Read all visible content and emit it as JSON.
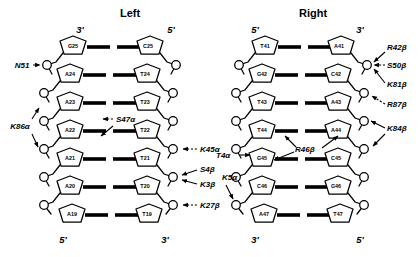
{
  "figure": {
    "type": "dna-protein-contact-map",
    "panels": [
      {
        "id": "left",
        "title": "Left",
        "top_left_end": "3'",
        "top_right_end": "5'",
        "bottom_left_end": "5'",
        "bottom_right_end": "3'",
        "strand_left": [
          "G25",
          "A24",
          "A23",
          "A22",
          "A21",
          "A20",
          "A19"
        ],
        "strand_right": [
          "C25",
          "T24",
          "T23",
          "T22",
          "T21",
          "T20",
          "T19"
        ],
        "annotations": [
          {
            "label": "N51",
            "side": "left",
            "style": "solid",
            "target_index": 0
          },
          {
            "label": "K86α",
            "side": "left",
            "style": "solid",
            "target_index": 1
          },
          {
            "label": "K86α",
            "side": "left",
            "style": "solid",
            "target_index": 2
          },
          {
            "label": "S47α",
            "side": "inner-left",
            "style": "dashed",
            "target_index": 2
          },
          {
            "label": "K45α",
            "side": "right",
            "style": "dashed",
            "target_index": 3
          },
          {
            "label": "S4β",
            "side": "right",
            "style": "solid",
            "target_index": 4
          },
          {
            "label": "K3β",
            "side": "right",
            "style": "solid",
            "target_index": 4
          },
          {
            "label": "K27β",
            "side": "right",
            "style": "dashed",
            "target_index": 5
          }
        ]
      },
      {
        "id": "right",
        "title": "Right",
        "top_left_end": "5'",
        "top_right_end": "3'",
        "bottom_left_end": "3'",
        "bottom_right_end": "5'",
        "strand_left": [
          "T41",
          "G42",
          "T43",
          "T44",
          "G45",
          "C46",
          "A47"
        ],
        "strand_right": [
          "A41",
          "C42",
          "A43",
          "A44",
          "C45",
          "G46",
          "T47"
        ],
        "annotations": [
          {
            "label": "R42β",
            "side": "right",
            "style": "solid",
            "target_index": 0
          },
          {
            "label": "S50β",
            "side": "right",
            "style": "dashed",
            "target_index": 0
          },
          {
            "label": "K81β",
            "side": "right",
            "style": "solid",
            "target_index": 0
          },
          {
            "label": "R87β",
            "side": "right",
            "style": "dashed",
            "target_index": 1
          },
          {
            "label": "K84β",
            "side": "right",
            "style": "solid",
            "target_index": 2
          },
          {
            "label": "K84β",
            "side": "right",
            "style": "solid",
            "target_index": 3
          },
          {
            "label": "T4α",
            "side": "left",
            "style": "solid",
            "target_index": 3
          },
          {
            "label": "R46β",
            "side": "inner",
            "style": "solid",
            "target_index": 4
          },
          {
            "label": "K5α",
            "side": "left",
            "style": "solid",
            "target_index": 5
          }
        ]
      }
    ],
    "colors": {
      "background": "#ffffff",
      "ink": "#000000"
    }
  }
}
